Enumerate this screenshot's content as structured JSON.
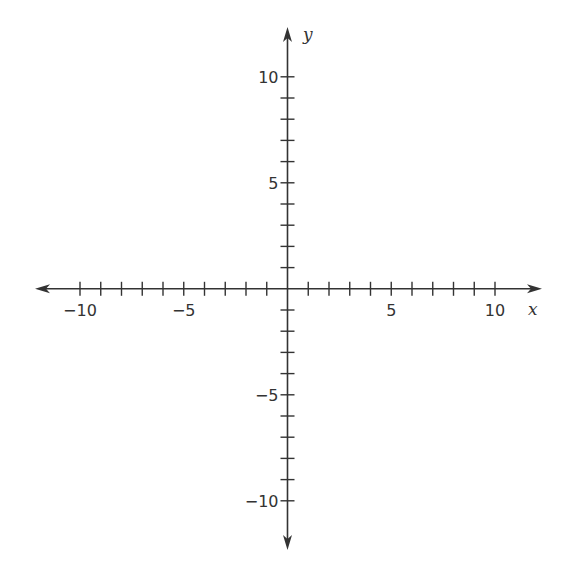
{
  "chart_data": {
    "type": "scatter",
    "title": "",
    "xlabel": "x",
    "ylabel": "y",
    "xlim": [
      -10,
      10
    ],
    "ylim": [
      -10,
      10
    ],
    "grid": false,
    "x_ticks": [
      -10,
      -9,
      -8,
      -7,
      -6,
      -5,
      -4,
      -3,
      -2,
      -1,
      1,
      2,
      3,
      4,
      5,
      6,
      7,
      8,
      9,
      10
    ],
    "y_ticks": [
      -10,
      -9,
      -8,
      -7,
      -6,
      -5,
      -4,
      -3,
      -2,
      -1,
      1,
      2,
      3,
      4,
      5,
      6,
      7,
      8,
      9,
      10
    ],
    "x_tick_labels": [
      "-10",
      "-5",
      "5",
      "10"
    ],
    "y_tick_labels": [
      "10",
      "5",
      "-5",
      "-10"
    ],
    "series": []
  },
  "axes": {
    "x_label": "x",
    "y_label": "y",
    "x_labels": [
      {
        "value": -10,
        "text": "−10"
      },
      {
        "value": -5,
        "text": "−5"
      },
      {
        "value": 5,
        "text": "5"
      },
      {
        "value": 10,
        "text": "10"
      }
    ],
    "y_labels": [
      {
        "value": 10,
        "text": "10"
      },
      {
        "value": 5,
        "text": "5"
      },
      {
        "value": -5,
        "text": "−5"
      },
      {
        "value": -10,
        "text": "−10"
      }
    ],
    "color": "#333333"
  }
}
